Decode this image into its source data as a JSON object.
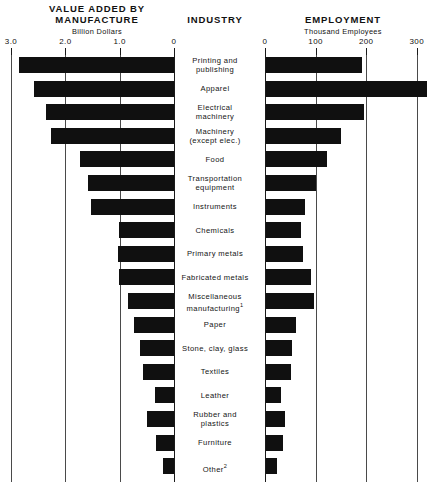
{
  "headers": {
    "left_title": "VALUE ADDED BY MANUFACTURE",
    "left_title_line1": "VALUE ADDED BY",
    "left_title_line2": "MANUFACTURE",
    "center_title": "INDUSTRY",
    "right_title": "EMPLOYMENT",
    "left_unit": "Billion Dollars",
    "right_unit": "Thousand Employees"
  },
  "chart_data": {
    "type": "bar",
    "orientation": "horizontal",
    "layout": "paired-mirrored-bars",
    "grid": true,
    "legend": "none",
    "categories": [
      "Printing and publishing",
      "Apparel",
      "Electrical machinery",
      "Machinery (except elec.)",
      "Food",
      "Transportation equipment",
      "Instruments",
      "Chemicals",
      "Primary metals",
      "Fabricated metals",
      "Miscellaneous manufacturing¹",
      "Paper",
      "Stone, clay, glass",
      "Textiles",
      "Leather",
      "Rubber and plastics",
      "Furniture",
      "Other²"
    ],
    "category_lines": [
      [
        "Printing and",
        "publishing"
      ],
      [
        "Apparel"
      ],
      [
        "Electrical",
        "machinery"
      ],
      [
        "Machinery",
        "(except elec.)"
      ],
      [
        "Food"
      ],
      [
        "Transportation",
        "equipment"
      ],
      [
        "Instruments"
      ],
      [
        "Chemicals"
      ],
      [
        "Primary metals"
      ],
      [
        "Fabricated metals"
      ],
      [
        "Miscellaneous",
        "manufacturing¹"
      ],
      [
        "Paper"
      ],
      [
        "Stone, clay, glass"
      ],
      [
        "Textiles"
      ],
      [
        "Leather"
      ],
      [
        "Rubber and",
        "plastics"
      ],
      [
        "Furniture"
      ],
      [
        "Other²"
      ]
    ],
    "series": [
      {
        "name": "Value added by manufacture",
        "unit": "Billion Dollars",
        "xlabel": "Billion Dollars",
        "direction": "right-to-left",
        "axis_ticks": [
          3.0,
          2.0,
          1.0,
          0
        ],
        "axis_tick_labels": [
          "3.0",
          "2.0",
          "1.0",
          "0"
        ],
        "xlim": [
          0,
          3.0
        ],
        "values": [
          2.86,
          2.58,
          2.36,
          2.27,
          1.73,
          1.58,
          1.53,
          1.01,
          1.03,
          1.01,
          0.85,
          0.74,
          0.62,
          0.57,
          0.35,
          0.5,
          0.33,
          0.2
        ]
      },
      {
        "name": "Employment",
        "unit": "Thousand Employees",
        "xlabel": "Thousand Employees",
        "direction": "left-to-right",
        "axis_ticks": [
          0,
          100,
          200,
          300
        ],
        "axis_tick_labels": [
          "0",
          "100",
          "200",
          "300"
        ],
        "xlim": [
          0,
          320
        ],
        "values": [
          190,
          318,
          194,
          148,
          120,
          98,
          78,
          70,
          73,
          89,
          94,
          59,
          51,
          49,
          30,
          37,
          33,
          22
        ]
      }
    ]
  },
  "footnotes": {
    "marker1": "1",
    "marker2": "2"
  },
  "colors": {
    "bar": "#101010",
    "grid": "#4a4a4a",
    "axis": "#1a1a1a",
    "background": "#ffffff",
    "text": "#111111"
  }
}
